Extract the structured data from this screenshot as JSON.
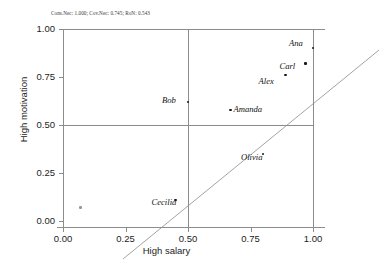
{
  "chart_data": {
    "type": "scatter",
    "title": "Cons.Nec: 1.000; Cov.Nec: 0.745; RoN: 0.543",
    "xlabel": "High salary",
    "ylabel": "High motivation",
    "xlim": [
      0.0,
      1.0
    ],
    "ylim": [
      0.0,
      1.0
    ],
    "xticks": [
      "0.00",
      "0.25",
      "0.50",
      "0.75",
      "1.00"
    ],
    "yticks": [
      "0.00",
      "0.25",
      "0.50",
      "0.75",
      "1.00"
    ],
    "xtick_values": [
      0.0,
      0.25,
      0.5,
      0.75,
      1.0
    ],
    "ytick_values": [
      0.0,
      0.25,
      0.5,
      0.75,
      1.0
    ],
    "grid": false,
    "legend": "none",
    "reference_lines": [
      {
        "name": "diagonal",
        "type": "identity",
        "from": [
          0.0,
          0.0
        ],
        "to": [
          1.0,
          1.0
        ]
      },
      {
        "name": "h-mid",
        "type": "horizontal",
        "value": 0.5
      },
      {
        "name": "v-mid",
        "type": "vertical",
        "value": 0.5
      },
      {
        "name": "h-top",
        "type": "horizontal",
        "value": 1.0
      },
      {
        "name": "v-right",
        "type": "vertical",
        "value": 1.0
      }
    ],
    "points": [
      {
        "label": "Ana",
        "x": 1.0,
        "y": 0.9,
        "label_dx": -24,
        "label_dy": -10
      },
      {
        "label": "Carl",
        "x": 0.97,
        "y": 0.82,
        "label_dx": -26,
        "label_dy": -3
      },
      {
        "label": "Alex",
        "x": 0.89,
        "y": 0.76,
        "label_dx": -27,
        "label_dy": 1
      },
      {
        "label": "Bob",
        "x": 0.5,
        "y": 0.62,
        "label_dx": -26,
        "label_dy": -7
      },
      {
        "label": "Amanda",
        "x": 0.67,
        "y": 0.58,
        "label_dx": 3,
        "label_dy": -6
      },
      {
        "label": "Olivia",
        "x": 0.8,
        "y": 0.35,
        "label_dx": -22,
        "label_dy": -2
      },
      {
        "label": "Cecilia",
        "x": 0.45,
        "y": 0.11,
        "label_dx": -24,
        "label_dy": -3
      },
      {
        "label": "Sofia",
        "x": 0.07,
        "y": 0.07,
        "label_dx": 0,
        "label_dy": 0
      }
    ]
  }
}
